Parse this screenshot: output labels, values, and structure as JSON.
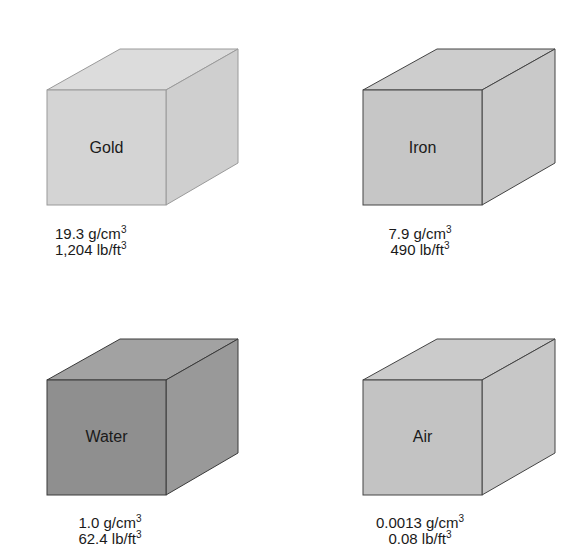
{
  "diagram": {
    "title": "",
    "cubes": [
      {
        "id": "gold",
        "label": "Gold",
        "density_metric_value": "19.3 g/cm",
        "density_metric_exp": "3",
        "density_imperial_value": "1,204 lb/ft",
        "density_imperial_exp": "3",
        "colors": {
          "front": "#d4d4d4",
          "top": "#dcdcdc",
          "side": "#cfcfcf",
          "edge": "#9a9a9a"
        }
      },
      {
        "id": "iron",
        "label": "Iron",
        "density_metric_value": "7.9 g/cm",
        "density_metric_exp": "3",
        "density_imperial_value": "490 lb/ft",
        "density_imperial_exp": "3",
        "colors": {
          "front": "#c6c6c6",
          "top": "#cdcdcd",
          "side": "#c9c9c9",
          "edge": "#444444"
        }
      },
      {
        "id": "water",
        "label": "Water",
        "density_metric_value": "1.0 g/cm",
        "density_metric_exp": "3",
        "density_imperial_value": "62.4 lb/ft",
        "density_imperial_exp": "3",
        "colors": {
          "front": "#8f8f8f",
          "top": "#a2a2a2",
          "side": "#999999",
          "edge": "#3a3a3a"
        }
      },
      {
        "id": "air",
        "label": "Air",
        "density_metric_value": "0.0013 g/cm",
        "density_metric_exp": "3",
        "density_imperial_value": "0.08 lb/ft",
        "density_imperial_exp": "3",
        "colors": {
          "front": "#c3c3c3",
          "top": "#cbcbcb",
          "side": "#c7c7c7",
          "edge": "#444444"
        }
      }
    ]
  }
}
